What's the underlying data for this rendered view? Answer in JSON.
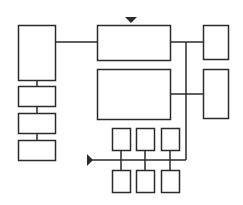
{
  "diagram": {
    "title": "",
    "stroke_color": "#2b2b2b",
    "fill_color": "#ffffff",
    "boxes": [
      {
        "id": "left-main",
        "x": 18,
        "y": 25,
        "w": 37,
        "h": 55
      },
      {
        "id": "left-stack-1",
        "x": 18,
        "y": 86,
        "w": 37,
        "h": 20
      },
      {
        "id": "left-stack-2",
        "x": 18,
        "y": 113,
        "w": 37,
        "h": 20
      },
      {
        "id": "left-stack-3",
        "x": 18,
        "y": 140,
        "w": 37,
        "h": 20
      },
      {
        "id": "center-top",
        "x": 97,
        "y": 25,
        "w": 73,
        "h": 35
      },
      {
        "id": "center-middle",
        "x": 97,
        "y": 69,
        "w": 73,
        "h": 50
      },
      {
        "id": "right-top",
        "x": 203,
        "y": 25,
        "w": 25,
        "h": 34
      },
      {
        "id": "right-bottom",
        "x": 203,
        "y": 69,
        "w": 25,
        "h": 49
      },
      {
        "id": "bus-top-1",
        "x": 112,
        "y": 128,
        "w": 18,
        "h": 22
      },
      {
        "id": "bus-top-2",
        "x": 136,
        "y": 128,
        "w": 18,
        "h": 22
      },
      {
        "id": "bus-top-3",
        "x": 161,
        "y": 128,
        "w": 18,
        "h": 22
      },
      {
        "id": "bus-bottom-1",
        "x": 112,
        "y": 170,
        "w": 18,
        "h": 22
      },
      {
        "id": "bus-bottom-2",
        "x": 136,
        "y": 170,
        "w": 18,
        "h": 22
      },
      {
        "id": "bus-bottom-3",
        "x": 161,
        "y": 170,
        "w": 18,
        "h": 22
      }
    ],
    "lines": [
      {
        "id": "left-to-center",
        "x1": 55,
        "y1": 42,
        "x2": 97,
        "y2": 42
      },
      {
        "id": "left-stack-conn-1",
        "x1": 37,
        "y1": 80,
        "x2": 37,
        "y2": 86
      },
      {
        "id": "left-stack-conn-2",
        "x1": 37,
        "y1": 106,
        "x2": 37,
        "y2": 113
      },
      {
        "id": "left-stack-conn-3",
        "x1": 37,
        "y1": 133,
        "x2": 37,
        "y2": 140
      },
      {
        "id": "center-top-to-right",
        "x1": 170,
        "y1": 42,
        "x2": 203,
        "y2": 42
      },
      {
        "id": "center-mid-to-right",
        "x1": 170,
        "y1": 94,
        "x2": 203,
        "y2": 94
      },
      {
        "id": "vertical-bus",
        "x1": 186,
        "y1": 42,
        "x2": 186,
        "y2": 160
      },
      {
        "id": "horizontal-bus",
        "x1": 90,
        "y1": 160,
        "x2": 186,
        "y2": 160
      },
      {
        "id": "bus-drop-1",
        "x1": 121,
        "y1": 150,
        "x2": 121,
        "y2": 170
      },
      {
        "id": "bus-drop-2",
        "x1": 145,
        "y1": 150,
        "x2": 145,
        "y2": 170
      },
      {
        "id": "bus-drop-3",
        "x1": 170,
        "y1": 150,
        "x2": 170,
        "y2": 170
      }
    ],
    "arrows": [
      {
        "id": "top-input-arrow",
        "direction": "down",
        "points": "125,17 137,17 131,23"
      },
      {
        "id": "bus-input-arrow",
        "direction": "right",
        "points": "87,154 87,166 93,160"
      }
    ]
  }
}
